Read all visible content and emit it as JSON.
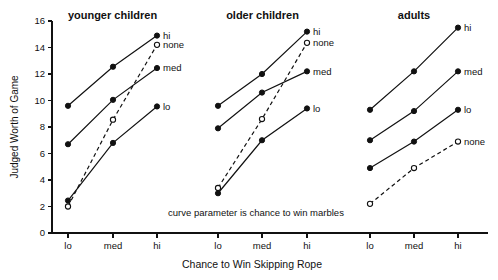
{
  "chart_data": {
    "type": "line",
    "title": "",
    "xlabel": "Chance to Win Skipping Rope",
    "ylabel": "Judged Worth of Game",
    "annotation": "curve parameter is chance to win marbles",
    "categories": [
      "lo",
      "med",
      "hi"
    ],
    "ylim": [
      0,
      16
    ],
    "yticks": [
      0,
      2,
      4,
      6,
      8,
      10,
      12,
      14,
      16
    ],
    "ytick_labels": [
      "0",
      "2",
      "4",
      "6",
      "8",
      "10",
      "12",
      "14",
      "16"
    ],
    "grid": false,
    "legend_position": "inline-right-of-each-panel",
    "panels": [
      {
        "title": "younger children",
        "series": [
          {
            "name": "hi",
            "label": "hi",
            "style": "solid",
            "marker": "filled",
            "values": [
              9.6,
              12.55,
              14.9
            ]
          },
          {
            "name": "none",
            "label": "none",
            "style": "dashed",
            "marker": "open",
            "values": [
              2.0,
              8.55,
              14.2
            ]
          },
          {
            "name": "med",
            "label": "med",
            "style": "solid",
            "marker": "filled",
            "values": [
              6.7,
              10.05,
              12.45
            ]
          },
          {
            "name": "lo",
            "label": "lo",
            "style": "solid",
            "marker": "filled",
            "values": [
              2.45,
              6.8,
              9.55
            ]
          }
        ]
      },
      {
        "title": "older children",
        "series": [
          {
            "name": "hi",
            "label": "hi",
            "style": "solid",
            "marker": "filled",
            "values": [
              9.6,
              12.0,
              15.2
            ]
          },
          {
            "name": "none",
            "label": "none",
            "style": "dashed",
            "marker": "open",
            "values": [
              3.4,
              8.6,
              14.35
            ]
          },
          {
            "name": "med",
            "label": "med",
            "style": "solid",
            "marker": "filled",
            "values": [
              7.9,
              10.6,
              12.2
            ]
          },
          {
            "name": "lo",
            "label": "lo",
            "style": "solid",
            "marker": "filled",
            "values": [
              3.0,
              7.0,
              9.4
            ]
          }
        ]
      },
      {
        "title": "adults",
        "series": [
          {
            "name": "hi",
            "label": "hi",
            "style": "solid",
            "marker": "filled",
            "values": [
              9.3,
              12.2,
              15.5
            ]
          },
          {
            "name": "med",
            "label": "med",
            "style": "solid",
            "marker": "filled",
            "values": [
              7.0,
              9.2,
              12.2
            ]
          },
          {
            "name": "lo",
            "label": "lo",
            "style": "solid",
            "marker": "filled",
            "values": [
              4.9,
              6.9,
              9.3
            ]
          },
          {
            "name": "none",
            "label": "none",
            "style": "dashed",
            "marker": "open",
            "values": [
              2.2,
              4.9,
              6.9
            ]
          }
        ]
      }
    ]
  }
}
